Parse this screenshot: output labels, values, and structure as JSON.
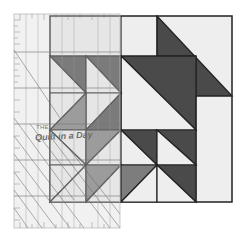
{
  "image": {
    "subject": "quilt block with clear acrylic ruler overlay",
    "width": 243,
    "height": 239
  },
  "ruler": {
    "brand_small": "THE",
    "brand_main": "Quilt in a Day",
    "tick_labels": [
      "6",
      "6½",
      "7"
    ]
  },
  "quilt_block": {
    "colors": {
      "dark": "#4a4a4a",
      "medium": "#7d7d7d",
      "light": "#eeeeee",
      "outline": "#222222"
    }
  }
}
